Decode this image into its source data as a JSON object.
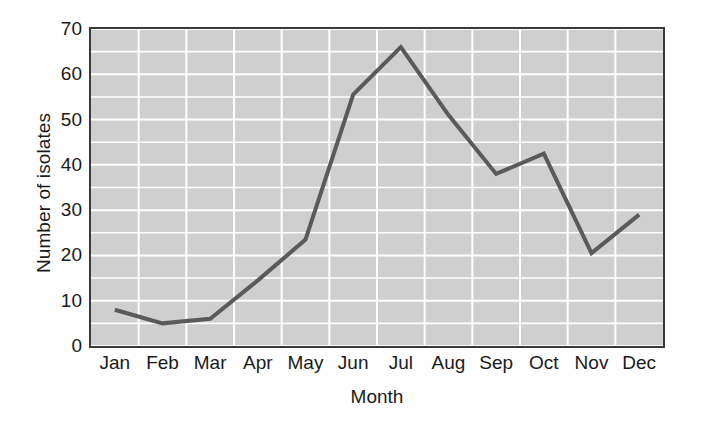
{
  "chart_data": {
    "type": "line",
    "title": "",
    "xlabel": "Month",
    "ylabel": "Number of isolates",
    "categories": [
      "Jan",
      "Feb",
      "Mar",
      "Apr",
      "May",
      "Jun",
      "Jul",
      "Aug",
      "Sep",
      "Oct",
      "Nov",
      "Dec"
    ],
    "values": [
      8,
      5,
      6,
      14.5,
      23.5,
      55.5,
      66,
      51,
      38,
      42.5,
      20.5,
      29
    ],
    "series": [
      {
        "name": "Number of isolates",
        "values": [
          8,
          5,
          6,
          14.5,
          23.5,
          55.5,
          66,
          51,
          38,
          42.5,
          20.5,
          29
        ]
      }
    ],
    "ylim": [
      0,
      70
    ],
    "yticks": [
      0,
      10,
      20,
      30,
      40,
      50,
      60,
      70
    ],
    "ytick_labels": [
      "0",
      "10",
      "20",
      "30",
      "40",
      "50",
      "60",
      "70"
    ],
    "minor_ytick_step": 5,
    "grid": true,
    "grid_color": "#ffffff",
    "plot_background": "#cfcfcf",
    "line_color": "#5a5a5a",
    "line_width": 4,
    "legend": "none",
    "markers": "none"
  },
  "figure": {
    "background": "#ffffff",
    "frame_color": "#3a3a3a",
    "text_color": "#1a1a1a"
  }
}
